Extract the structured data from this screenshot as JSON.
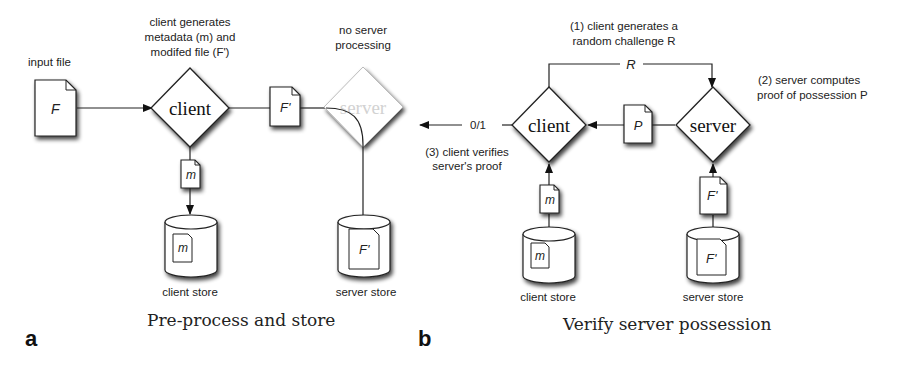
{
  "panel_a": {
    "letter": "a",
    "caption": "Pre-process and store",
    "input_label": "input file",
    "input_file": "F",
    "client_note": [
      "client generates",
      "metadata (m) and",
      "modifed file (F')"
    ],
    "client_node": "client",
    "modified_file": "F'",
    "server_note": [
      "no server",
      "processing"
    ],
    "server_node": "server",
    "metadata_file": "m",
    "client_store_label": "client store",
    "client_store_file": "m",
    "server_store_label": "server store",
    "server_store_file": "F'"
  },
  "panel_b": {
    "letter": "b",
    "caption": "Verify server possession",
    "step1": [
      "(1) client generates a",
      "random challenge R"
    ],
    "challenge": "R",
    "step2": [
      "(2) server computes",
      "proof of possession P"
    ],
    "step3": [
      "(3) client verifies",
      "server's proof"
    ],
    "result": "0/1",
    "client_node": "client",
    "server_node": "server",
    "proof_file": "P",
    "metadata_file": "m",
    "server_file": "F'",
    "client_store_label": "client store",
    "client_store_file": "m",
    "server_store_label": "server store",
    "server_store_file": "F'"
  }
}
